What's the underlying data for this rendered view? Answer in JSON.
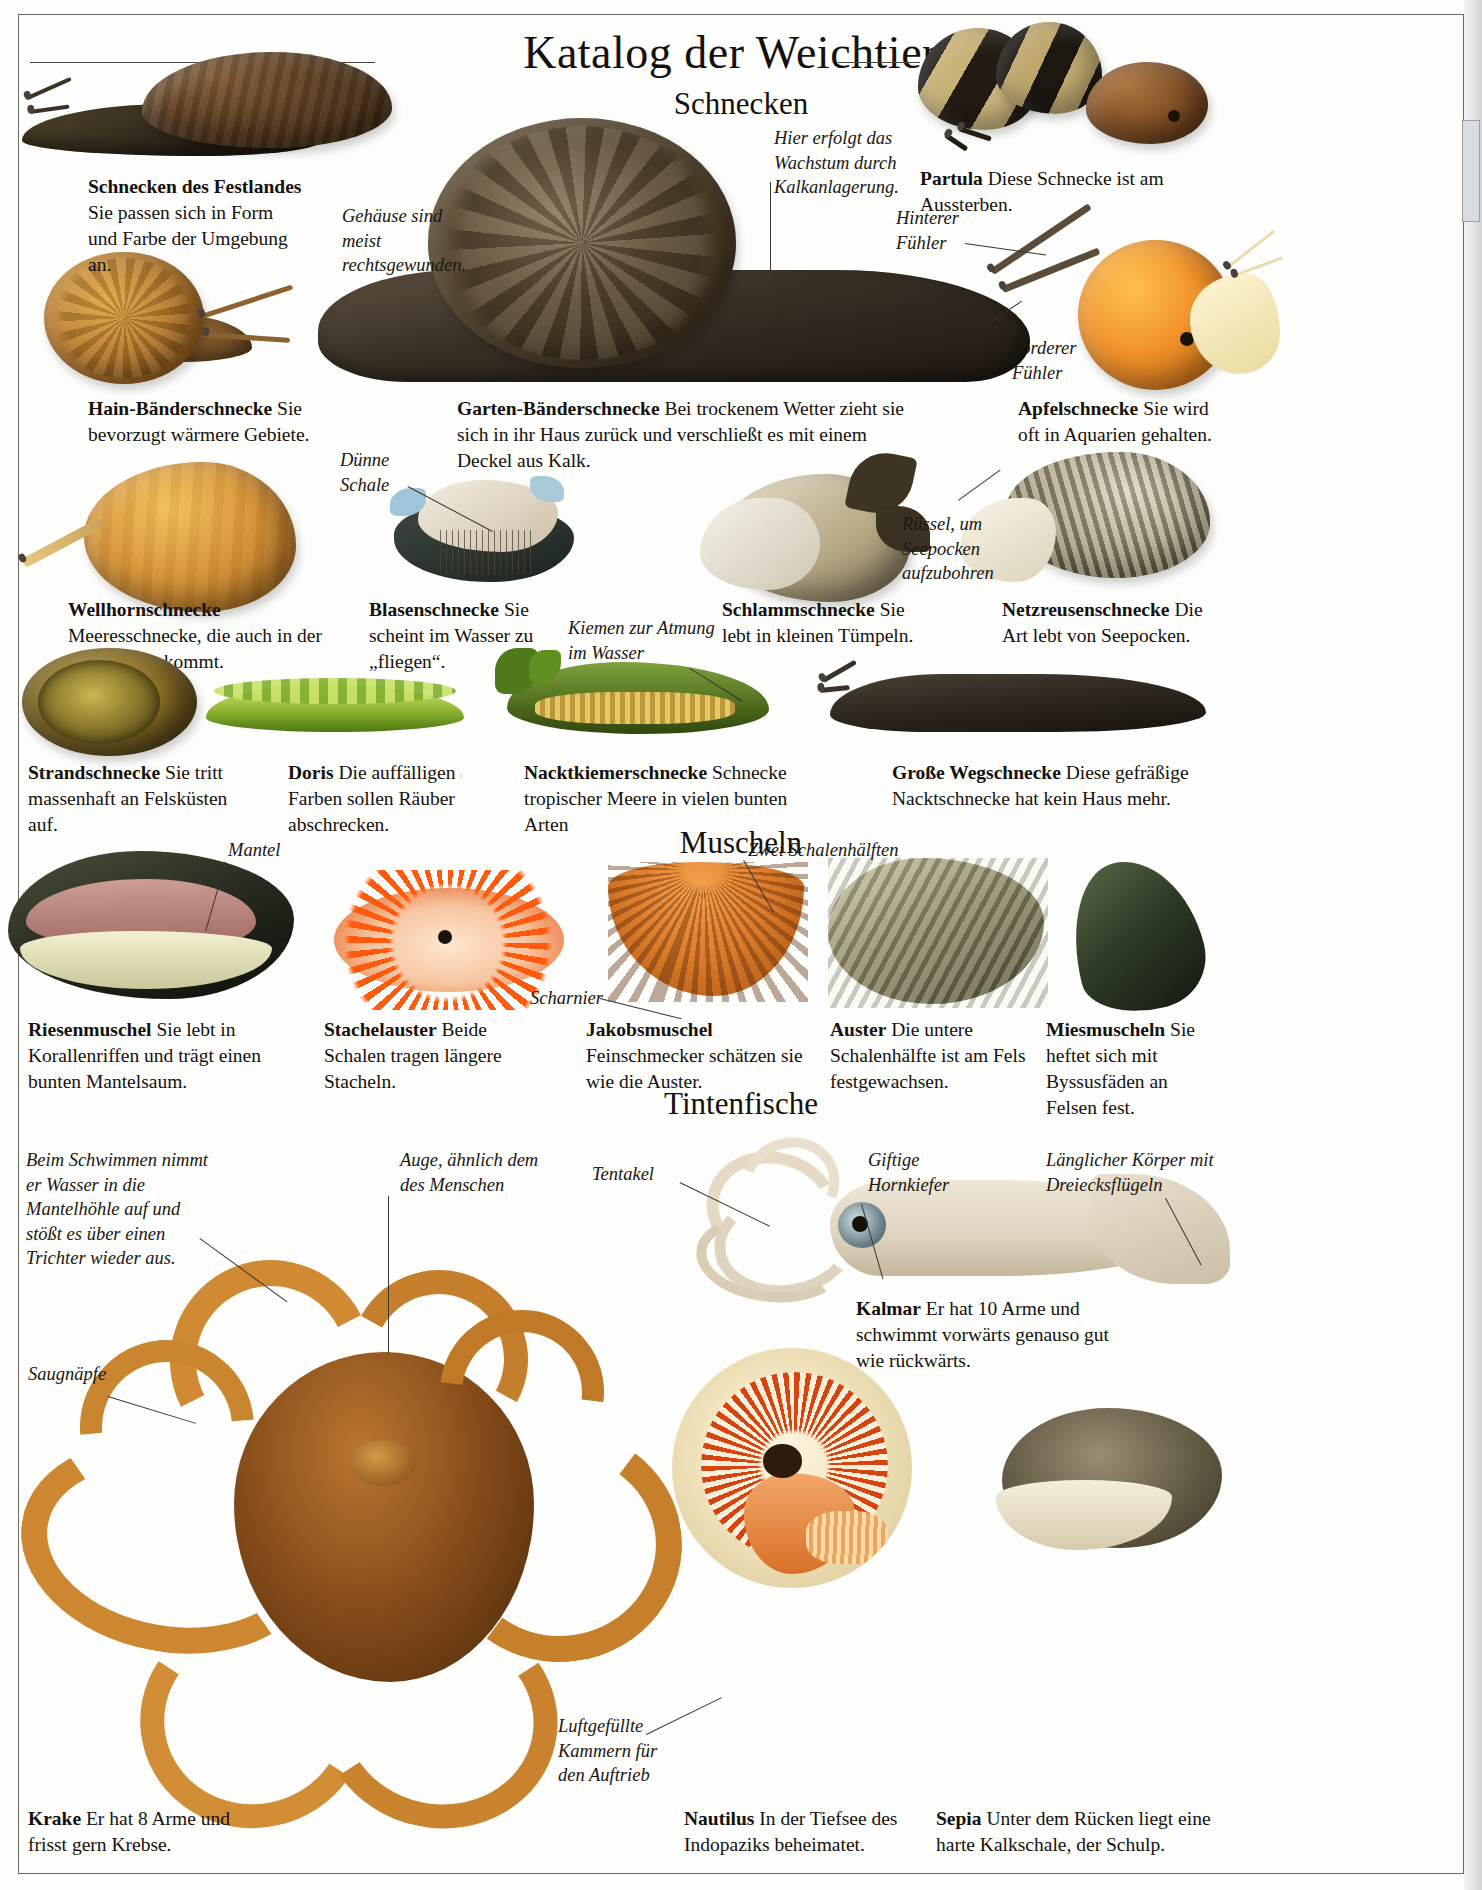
{
  "page": {
    "title": "Katalog der Weichtiere",
    "sections": [
      {
        "id": "schnecken",
        "heading": "Schnecken"
      },
      {
        "id": "muscheln",
        "heading": "Muscheln"
      },
      {
        "id": "tintenfische",
        "heading": "Tintenfische"
      }
    ]
  },
  "captions": {
    "schnecken_des_festlandes": {
      "name": "Schnecken des Festlandes",
      "text": "Sie passen sich in Form und Farbe der Umgebung an."
    },
    "partula": {
      "name": "Partula",
      "text": "Diese Schnecke ist am Aussterben."
    },
    "hain_baenderschnecke": {
      "name": "Hain-Bänderschnecke",
      "text": "Sie bevorzugt wärmere Gebiete."
    },
    "garten_baenderschnecke": {
      "name": "Garten-Bänderschnecke",
      "text": "Bei trockenem Wetter zieht sie sich in ihr Haus zurück und verschließt es mit einem Deckel aus Kalk."
    },
    "apfelschnecke": {
      "name": "Apfelschnecke",
      "text": "Sie wird oft in Aquarien gehalten."
    },
    "wellhornschnecke": {
      "name": "Wellhornschnecke",
      "text": "Meeresschnecke, die auch in der Nordsee vorkommt."
    },
    "blasenschnecke": {
      "name": "Blasenschnecke",
      "text": "Sie scheint im Wasser zu „fliegen“."
    },
    "schlammschnecke": {
      "name": "Schlammschnecke",
      "text": "Sie lebt in kleinen Tümpeln."
    },
    "netzreusenschnecke": {
      "name": "Netzreusenschnecke",
      "text": "Die Art lebt von Seepocken."
    },
    "strandschnecke": {
      "name": "Strandschnecke",
      "text": "Sie tritt massenhaft an Felsküsten auf."
    },
    "doris": {
      "name": "Doris",
      "text": "Die auffälligen Farben sollen Räuber abschrecken."
    },
    "nacktkiemerschnecke": {
      "name": "Nacktkiemerschnecke",
      "text": "Schnecke tropischer Meere in vielen bunten Arten"
    },
    "grosse_wegschnecke": {
      "name": "Große Wegschnecke",
      "text": "Diese gefräßige Nacktschnecke hat kein Haus mehr."
    },
    "riesenmuschel": {
      "name": "Riesenmuschel",
      "text": "Sie lebt in Korallenriffen und trägt einen bunten Mantelsaum."
    },
    "stachelauster": {
      "name": "Stachelauster",
      "text": "Beide Schalen tragen längere Stacheln."
    },
    "jakobsmuschel": {
      "name": "Jakobsmuschel",
      "text": "Feinschmecker schätzen sie wie die Auster."
    },
    "auster": {
      "name": "Auster",
      "text": "Die untere Schalenhälfte ist am Fels festgewachsen."
    },
    "miesmuscheln": {
      "name": "Miesmuscheln",
      "text": "Sie heftet sich mit Byssusfäden an Felsen fest."
    },
    "kalmar": {
      "name": "Kalmar",
      "text": "Er hat 10 Arme und schwimmt vorwärts genauso gut wie rückwärts."
    },
    "krake": {
      "name": "Krake",
      "text": "Er hat 8 Arme und frisst gern Krebse."
    },
    "nautilus": {
      "name": "Nautilus",
      "text": "In der Tiefsee des Indopaziks beheimatet."
    },
    "sepia": {
      "name": "Sepia",
      "text": "Unter dem Rücken liegt eine harte Kalkschale, der Schulp."
    }
  },
  "annotations": {
    "gehaeuse": "Gehäuse sind meist rechtsgewunden.",
    "wachstum": "Hier erfolgt das Wachstum durch Kalkanlagerung.",
    "hinterer_fuehler": "Hinterer Fühler",
    "vorderer_fuehler": "Vorderer Fühler",
    "duenne_schale": "Dünne Schale",
    "ruessel": "Rüssel, um Seepocken aufzubohren",
    "kiemen": "Kiemen zur Atmung im Wasser",
    "mantel": "Mantel",
    "zwei_schalenhaelften": "Zwei Schalenhälften",
    "scharnier": "Scharnier",
    "schwimmen": "Beim Schwimmen nimmt er Wasser in die Mantelhöhle auf und stößt es über einen Trichter wieder aus.",
    "auge": "Auge, ähnlich dem des Menschen",
    "saugnaepfe": "Saugnäpfe",
    "tentakel": "Tentakel",
    "giftige_hornkiefer": "Giftige Hornkiefer",
    "laenglicher_koerper": "Länglicher Körper mit Dreiecksflügeln",
    "luftgefuellte_kammern": "Luftgefüllte Kammern für den Auftrieb"
  },
  "colors": {
    "ink": "#14110e",
    "rule": "#6b6b63",
    "shell_brown": "#6a4a2b",
    "shell_orange": "#d2902f",
    "slug_dark": "#3b3228",
    "coral_orange": "#e8520f",
    "mussel_green": "#3c4a32"
  }
}
